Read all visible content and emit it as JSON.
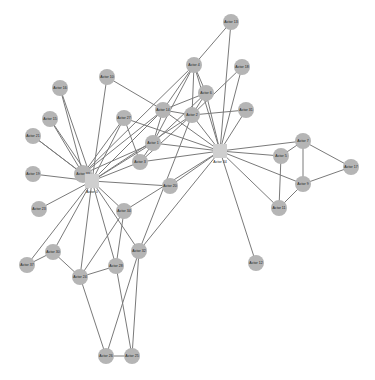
{
  "graph": {
    "node_color": "#b5b5b5",
    "hub_color": "#cfcfcf",
    "edge_color": "#7a7a7a",
    "nodes": [
      {
        "id": "n0",
        "label": "Actor 33",
        "x": 83,
        "y": 174,
        "r": 9
      },
      {
        "id": "n1",
        "label": "Actor 13",
        "x": 231,
        "y": 22,
        "r": 8
      },
      {
        "id": "n2",
        "label": "Actor 4",
        "x": 194,
        "y": 65,
        "r": 8
      },
      {
        "id": "n3",
        "label": "Actor 18",
        "x": 242,
        "y": 67,
        "r": 8
      },
      {
        "id": "n4",
        "label": "Actor 6",
        "x": 206,
        "y": 93,
        "r": 8
      },
      {
        "id": "n5",
        "label": "Actor 10",
        "x": 107,
        "y": 77,
        "r": 8
      },
      {
        "id": "n6",
        "label": "Actor 16",
        "x": 60,
        "y": 88,
        "r": 8
      },
      {
        "id": "n7",
        "label": "Actor 14",
        "x": 163,
        "y": 110,
        "r": 8
      },
      {
        "id": "n8",
        "label": "Actor 2",
        "x": 192,
        "y": 115,
        "r": 8
      },
      {
        "id": "n9",
        "label": "Actor 31",
        "x": 246,
        "y": 110,
        "r": 8
      },
      {
        "id": "n10",
        "label": "Actor 15",
        "x": 50,
        "y": 119,
        "r": 8
      },
      {
        "id": "n11",
        "label": "Actor 27",
        "x": 124,
        "y": 118,
        "r": 8
      },
      {
        "id": "n12",
        "label": "Actor 21",
        "x": 33,
        "y": 136,
        "r": 8
      },
      {
        "id": "n13",
        "label": "Actor 1",
        "x": 153,
        "y": 143,
        "r": 8
      },
      {
        "id": "n14",
        "label": "Actor 3",
        "x": 140,
        "y": 162,
        "r": 8
      },
      {
        "id": "n15",
        "label": "Actor 19",
        "x": 33,
        "y": 174,
        "r": 8
      },
      {
        "id": "n16",
        "label": "Actor 20",
        "x": 170,
        "y": 186,
        "r": 8
      },
      {
        "id": "n17",
        "label": "Actor 7",
        "x": 303,
        "y": 141,
        "r": 8
      },
      {
        "id": "n18",
        "label": "Actor 5",
        "x": 281,
        "y": 156,
        "r": 8
      },
      {
        "id": "n19",
        "label": "Actor 17",
        "x": 351,
        "y": 167,
        "r": 8
      },
      {
        "id": "n20",
        "label": "Actor 9",
        "x": 303,
        "y": 184,
        "r": 8
      },
      {
        "id": "n21",
        "label": "Actor 23",
        "x": 39,
        "y": 209,
        "r": 8
      },
      {
        "id": "n22",
        "label": "Actor 34",
        "x": 124,
        "y": 211,
        "r": 8
      },
      {
        "id": "n23",
        "label": "Actor 11",
        "x": 279,
        "y": 208,
        "r": 8
      },
      {
        "id": "n24",
        "label": "Actor 30",
        "x": 53,
        "y": 252,
        "r": 8
      },
      {
        "id": "n25",
        "label": "Actor 32",
        "x": 139,
        "y": 251,
        "r": 8
      },
      {
        "id": "n26",
        "label": "Actor 37",
        "x": 27,
        "y": 265,
        "r": 8
      },
      {
        "id": "n27",
        "label": "Actor 28",
        "x": 116,
        "y": 266,
        "r": 8
      },
      {
        "id": "n28",
        "label": "Actor 24",
        "x": 80,
        "y": 277,
        "r": 8
      },
      {
        "id": "n29",
        "label": "Actor 12",
        "x": 256,
        "y": 263,
        "r": 8
      },
      {
        "id": "n30",
        "label": "Actor 26",
        "x": 106,
        "y": 356,
        "r": 8
      },
      {
        "id": "n31",
        "label": "Actor 25",
        "x": 132,
        "y": 356,
        "r": 8
      }
    ],
    "hubs": [
      {
        "id": "h0",
        "label": "Actor 0",
        "x": 92,
        "y": 181,
        "size": 14
      },
      {
        "id": "h1",
        "label": "Actor 34",
        "x": 220,
        "y": 151,
        "size": 14
      }
    ],
    "edges": [
      [
        "h0",
        "n5"
      ],
      [
        "h0",
        "n6"
      ],
      [
        "h0",
        "n10"
      ],
      [
        "h0",
        "n12"
      ],
      [
        "h0",
        "n15"
      ],
      [
        "h0",
        "n21"
      ],
      [
        "h0",
        "n11"
      ],
      [
        "h0",
        "n13"
      ],
      [
        "h0",
        "n14"
      ],
      [
        "h0",
        "n7"
      ],
      [
        "h0",
        "n8"
      ],
      [
        "h0",
        "n22"
      ],
      [
        "h0",
        "n24"
      ],
      [
        "h0",
        "n28"
      ],
      [
        "h0",
        "n27"
      ],
      [
        "h0",
        "n25"
      ],
      [
        "h0",
        "n16"
      ],
      [
        "h0",
        "n26"
      ],
      [
        "n0",
        "n6"
      ],
      [
        "n0",
        "n10"
      ],
      [
        "n0",
        "n12"
      ],
      [
        "n0",
        "n11"
      ],
      [
        "n0",
        "n7"
      ],
      [
        "n0",
        "n13"
      ],
      [
        "n0",
        "n2"
      ],
      [
        "h1",
        "n1"
      ],
      [
        "h1",
        "n3"
      ],
      [
        "h1",
        "n9"
      ],
      [
        "h1",
        "n2"
      ],
      [
        "h1",
        "n4"
      ],
      [
        "h1",
        "n8"
      ],
      [
        "h1",
        "n7"
      ],
      [
        "h1",
        "n13"
      ],
      [
        "h1",
        "n14"
      ],
      [
        "h1",
        "n16"
      ],
      [
        "h1",
        "n17"
      ],
      [
        "h1",
        "n18"
      ],
      [
        "h1",
        "n20"
      ],
      [
        "h1",
        "n23"
      ],
      [
        "h1",
        "n29"
      ],
      [
        "h1",
        "n22"
      ],
      [
        "h1",
        "n25"
      ],
      [
        "h1",
        "n11"
      ],
      [
        "n1",
        "n2"
      ],
      [
        "n2",
        "n4"
      ],
      [
        "n2",
        "n8"
      ],
      [
        "n2",
        "n7"
      ],
      [
        "n2",
        "n13"
      ],
      [
        "n3",
        "n8"
      ],
      [
        "n4",
        "n8"
      ],
      [
        "n4",
        "n7"
      ],
      [
        "n4",
        "n13"
      ],
      [
        "n8",
        "n9"
      ],
      [
        "n8",
        "n14"
      ],
      [
        "n7",
        "n8"
      ],
      [
        "n7",
        "n13"
      ],
      [
        "n5",
        "n7"
      ],
      [
        "n11",
        "n14"
      ],
      [
        "n13",
        "n14"
      ],
      [
        "n8",
        "n25"
      ],
      [
        "n17",
        "n18"
      ],
      [
        "n17",
        "n19"
      ],
      [
        "n17",
        "n20"
      ],
      [
        "n18",
        "n23"
      ],
      [
        "n19",
        "n20"
      ],
      [
        "n20",
        "n23"
      ],
      [
        "n24",
        "n26"
      ],
      [
        "n24",
        "n28"
      ],
      [
        "n28",
        "n27"
      ],
      [
        "n28",
        "n30"
      ],
      [
        "n27",
        "n31"
      ],
      [
        "n25",
        "n30"
      ],
      [
        "n25",
        "n31"
      ],
      [
        "n30",
        "n31"
      ],
      [
        "n22",
        "n28"
      ],
      [
        "n22",
        "n27"
      ]
    ]
  }
}
